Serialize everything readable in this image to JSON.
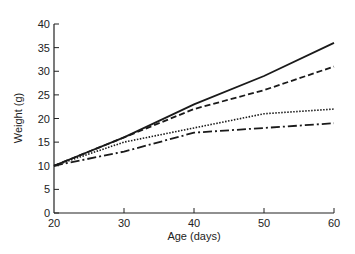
{
  "chart_data": {
    "type": "line",
    "title": "",
    "xlabel": "Age (days)",
    "ylabel": "Weight (g)",
    "x": [
      20,
      30,
      40,
      50,
      60
    ],
    "xticks": [
      "20",
      "30",
      "40",
      "50",
      "60"
    ],
    "yticks": [
      "0",
      "5",
      "10",
      "15",
      "20",
      "25",
      "30",
      "35",
      "40"
    ],
    "xlim": [
      20,
      60
    ],
    "ylim": [
      0,
      40
    ],
    "grid": false,
    "legend": null,
    "series": [
      {
        "name": "solid",
        "style": "solid",
        "values": [
          10,
          16,
          23,
          29,
          36
        ]
      },
      {
        "name": "dashed",
        "style": "dashed",
        "values": [
          10,
          16,
          22,
          26,
          31
        ]
      },
      {
        "name": "dotted",
        "style": "dotted",
        "values": [
          10,
          15,
          18,
          21,
          22
        ]
      },
      {
        "name": "dash-dot",
        "style": "dashdot",
        "values": [
          10,
          13,
          17,
          18,
          19
        ]
      }
    ]
  }
}
